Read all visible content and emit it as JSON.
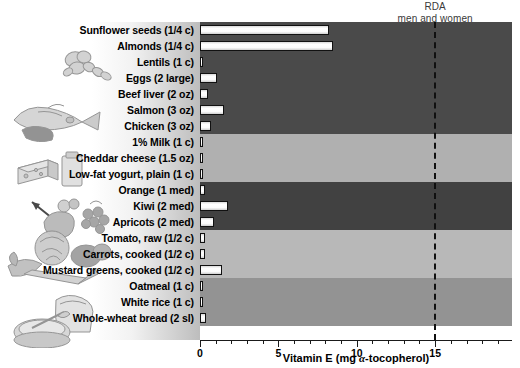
{
  "annotation": {
    "rda_line1": "RDA",
    "rda_line2": "men and women",
    "rda_value": 15
  },
  "axis": {
    "title_text": "Vitamin E (mg ",
    "title_symbol": "α",
    "title_tail": "-tocopherol)",
    "tick_labels": [
      "0",
      "5",
      "10",
      "15"
    ],
    "tick_values": [
      0,
      5,
      10,
      15
    ],
    "min": 0,
    "max": 19.9
  },
  "illustrations": [
    {
      "name": "nuts-and-seeds-illustration"
    },
    {
      "name": "meat-fish-eggs-illustration"
    },
    {
      "name": "dairy-cheese-milk-illustration"
    },
    {
      "name": "fruit-illustration"
    },
    {
      "name": "vegetables-illustration"
    },
    {
      "name": "grains-bread-cereal-illustration"
    }
  ],
  "chart_data": {
    "type": "bar",
    "title": "",
    "xlabel": "Vitamin E (mg α-tocopherol)",
    "ylabel": "",
    "xlim": [
      0,
      19.9
    ],
    "grid": false,
    "orientation": "horizontal",
    "reference_line": {
      "label": "RDA men and women",
      "value": 15
    },
    "categories": [
      "Sunflower seeds (1/4 c)",
      "Almonds (1/4 c)",
      "Lentils (1 c)",
      "Eggs (2 large)",
      "Beef liver (2 oz)",
      "Salmon (3 oz)",
      "Chicken (3 oz)",
      "1% Milk (1 c)",
      "Cheddar cheese (1.5 oz)",
      "Low-fat yogurt, plain (1 c)",
      "Orange (1 med)",
      "Kiwi (2 med)",
      "Apricots (2 med)",
      "Tomato, raw (1/2 c)",
      "Carrots, cooked (1/2 c)",
      "Mustard greens, cooked (1/2 c)",
      "Oatmeal (1 c)",
      "White rice (1 c)",
      "Whole-wheat bread (2 sl)"
    ],
    "values": [
      8.2,
      8.5,
      0.2,
      1.1,
      0.5,
      1.5,
      0.7,
      0.1,
      0.1,
      0.1,
      0.3,
      1.8,
      0.9,
      0.3,
      0.3,
      1.4,
      0.2,
      0.1,
      0.4
    ],
    "groups": [
      {
        "name": "nuts-seeds-protein",
        "rows": 7,
        "band_color": "#4a4a4a"
      },
      {
        "name": "dairy",
        "rows": 3,
        "band_color": "#b0b0b0"
      },
      {
        "name": "fruit",
        "rows": 3,
        "band_color": "#414141"
      },
      {
        "name": "vegetables",
        "rows": 3,
        "band_color": "#b8b8b8"
      },
      {
        "name": "grains",
        "rows": 3,
        "band_color": "#939393"
      }
    ]
  }
}
